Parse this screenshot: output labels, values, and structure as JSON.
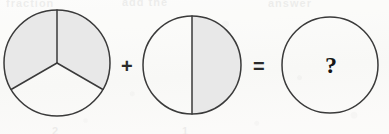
{
  "page": {
    "kind": "fraction-addition-worksheet-problem",
    "background_color": "#fbfbf9",
    "stroke_color": "#3a3a3a",
    "shade_color": "#e8e8e8",
    "ghost_text": {
      "top_left": "fraction",
      "top_mid": "add the",
      "top_right": "answer",
      "bottom_left": "2",
      "bottom_mid": "1"
    }
  },
  "equation": {
    "plus_symbol": "+",
    "equals_symbol": "=",
    "unknown_symbol": "?"
  },
  "figures": [
    {
      "name": "pie-thirds-two-shaded",
      "shape": "circle",
      "center_x": 57,
      "center_y": 63,
      "radius": 53,
      "total_parts": 3,
      "shaded_parts": 2,
      "fraction": "2/3",
      "divider_style": "three-radii-120-degrees",
      "start_angle_deg": -90,
      "shaded_sectors": [
        0,
        1
      ]
    },
    {
      "name": "pie-halves-right-shaded",
      "shape": "circle",
      "center_x": 192,
      "center_y": 65,
      "radius": 49,
      "total_parts": 2,
      "shaded_parts": 1,
      "fraction": "1/2",
      "divider_style": "vertical-diameter",
      "shaded_sectors": [
        1
      ]
    },
    {
      "name": "pie-empty-unknown",
      "shape": "circle",
      "center_x": 330,
      "center_y": 65,
      "radius": 48,
      "total_parts": 1,
      "shaded_parts": 0,
      "fraction": "?",
      "divider_style": "none",
      "shaded_sectors": []
    }
  ]
}
